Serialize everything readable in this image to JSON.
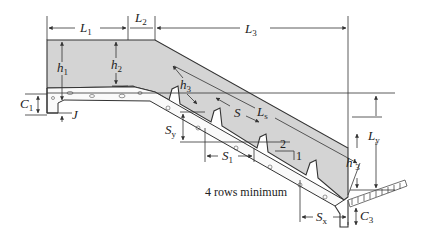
{
  "diagram": {
    "colors": {
      "concrete_fill": "#d4d4d4",
      "line": "#333333",
      "background": "#ffffff"
    },
    "labels": {
      "L1": {
        "main": "L",
        "sub": "1"
      },
      "L2": {
        "main": "L",
        "sub": "2"
      },
      "L3": {
        "main": "L",
        "sub": "3"
      },
      "Ls": {
        "main": "L",
        "sub": "s"
      },
      "Ly": {
        "main": "L",
        "sub": "y"
      },
      "h1": {
        "main": "h",
        "sub": "1"
      },
      "h2": {
        "main": "h",
        "sub": "2"
      },
      "h3": {
        "main": "h",
        "sub": "3"
      },
      "h3prime": {
        "main": "h'",
        "sub": "3"
      },
      "C1": {
        "main": "C",
        "sub": "1"
      },
      "C3": {
        "main": "C",
        "sub": "3"
      },
      "J": {
        "main": "J"
      },
      "S": {
        "main": "S"
      },
      "S1": {
        "main": "S",
        "sub": "1"
      },
      "Sy": {
        "main": "S",
        "sub": "y"
      },
      "Sx": {
        "main": "S",
        "sub": "x"
      },
      "slope_run": "2",
      "slope_rise": "1",
      "riprap_note": "4 rows minimum"
    }
  }
}
